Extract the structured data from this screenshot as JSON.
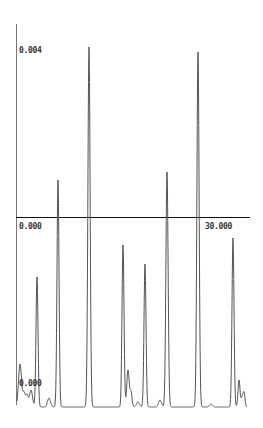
{
  "chart_data": {
    "type": "line",
    "title": "",
    "xlabel": "",
    "ylabel": "",
    "labels": {
      "y_top": "0.004",
      "x_origin": "0.000",
      "x_right": "30.000",
      "y_bottom": "0.000"
    },
    "xlim": [
      0,
      35
    ],
    "ylim": [
      0,
      0.004
    ],
    "grid": false,
    "peaks": [
      {
        "x": 0.6,
        "y": 0.00018,
        "width": 0.25
      },
      {
        "x": 1.5,
        "y": 0.0006,
        "width": 0.15
      },
      {
        "x": 2.4,
        "y": 0.00012,
        "width": 0.2
      },
      {
        "x": 6.2,
        "y": 0.00038,
        "width": 0.2
      },
      {
        "x": 11.7,
        "y": 0.00018,
        "width": 0.3
      },
      {
        "x": 11.2,
        "y": 0.0008,
        "width": 0.2
      },
      {
        "x": 15.1,
        "y": 0.00018,
        "width": 0.15
      },
      {
        "x": 15.1,
        "y": 0.00085,
        "width": 0.15
      },
      {
        "x": 16.0,
        "y": 0.00013,
        "width": 0.25
      },
      {
        "x": 17.4,
        "y": 0.00022,
        "width": 0.3
      },
      {
        "x": 18.4,
        "y": 0.0002,
        "width": 0.25
      },
      {
        "x": 20.0,
        "y": 0.00068,
        "width": 0.15
      },
      {
        "x": 21.3,
        "y": 0.00013,
        "width": 0.3
      },
      {
        "x": 24.0,
        "y": 0.00034,
        "width": 0.2
      },
      {
        "x": 30.0,
        "y": 0.0006,
        "width": 0.15
      },
      {
        "x": 31.3,
        "y": 0.00013,
        "width": 0.2
      },
      {
        "x": 32.0,
        "y": 0.0001,
        "width": 0.2
      }
    ],
    "series": [
      {
        "name": "signal",
        "x": [
          0.6,
          1.5,
          6.2,
          11.2,
          15.1,
          17.4,
          20.0,
          24.0,
          30.0,
          32.0
        ],
        "peak_heights": [
          0.00018,
          0.0006,
          0.00112,
          0.0018,
          0.00074,
          0.00067,
          0.00067,
          0.00115,
          0.00174,
          0.00084
        ]
      }
    ],
    "axes": {
      "y_axis_x_px": 16,
      "x_axis_y_px": 217,
      "baseline_y_px": 407
    }
  }
}
